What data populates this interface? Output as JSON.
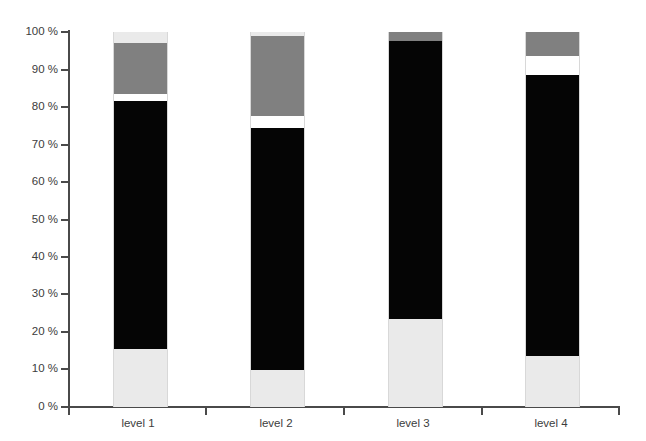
{
  "chart": {
    "title": "",
    "plot_background": "#ffffff",
    "axis_color": "#4a4a4a",
    "text_color": "#3c3c3c"
  },
  "chart_data": {
    "type": "bar",
    "subtype": "stacked-percentage",
    "title": "",
    "xlabel": "",
    "ylabel": "",
    "ylim": [
      0,
      100
    ],
    "y_unit": "%",
    "grid": false,
    "legend": "none",
    "categories": [
      "level 1",
      "level 2",
      "level 3",
      "level 4"
    ],
    "y_tick_labels": [
      "0 %",
      "10 %",
      "20 %",
      "30 %",
      "40 %",
      "50 %",
      "60 %",
      "70 %",
      "80 %",
      "90 %",
      "100 %"
    ],
    "y_tick_values": [
      0,
      10,
      20,
      30,
      40,
      50,
      60,
      70,
      80,
      90,
      100
    ],
    "series": [
      {
        "name": "light-gray-segment",
        "color": "#eaeaea",
        "values": [
          15.5,
          10.0,
          23.5,
          13.5
        ]
      },
      {
        "name": "black-segment",
        "color": "#050505",
        "values": [
          66.0,
          64.5,
          74.0,
          75.0
        ]
      },
      {
        "name": "white-segment",
        "color": "#ffffff",
        "values": [
          2.0,
          3.0,
          0.0,
          5.0
        ]
      },
      {
        "name": "gray-segment",
        "color": "#808080",
        "values": [
          13.5,
          21.5,
          2.5,
          6.5
        ]
      },
      {
        "name": "light-gray-top-segment",
        "color": "#eaeaea",
        "values": [
          3.0,
          1.0,
          0.0,
          0.0
        ]
      }
    ],
    "cumulative_tops": {
      "level 1": [
        15.5,
        81.5,
        83.5,
        97.0,
        100.0
      ],
      "level 2": [
        10.0,
        74.5,
        77.5,
        99.0,
        100.0
      ],
      "level 3": [
        23.5,
        97.5,
        97.5,
        100.0,
        100.0
      ],
      "level 4": [
        13.5,
        88.5,
        93.5,
        100.0,
        100.0
      ]
    }
  }
}
